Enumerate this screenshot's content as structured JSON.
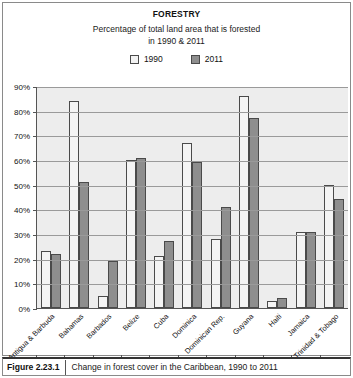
{
  "chart_data": {
    "type": "bar",
    "title": "FORESTRY",
    "subtitle_line1": "Percentage of total land area that is forested",
    "subtitle_line2": "in 1990 & 2011",
    "xlabel": "",
    "ylabel": "",
    "ylim": [
      0,
      90
    ],
    "ytick_labels": [
      "90%",
      "80%",
      "70%",
      "60%",
      "50%",
      "40%",
      "30%",
      "20%",
      "10%",
      "0%"
    ],
    "ytick_values": [
      90,
      80,
      70,
      60,
      50,
      40,
      30,
      20,
      10,
      0
    ],
    "grid": true,
    "legend_position": "top",
    "categories": [
      "Antigua & Barbuda",
      "Bahamas",
      "Barbados",
      "Belize",
      "Cuba",
      "Dominica",
      "Dominican Rep.",
      "Guyana",
      "Haiti",
      "Jamaica",
      "Trinidad & Tobago"
    ],
    "series": [
      {
        "name": "1990",
        "color": "#f4f4f4",
        "values": [
          23,
          84,
          5,
          60,
          21,
          67,
          28,
          86,
          3,
          31,
          50
        ]
      },
      {
        "name": "2011",
        "color": "#8e8e8e",
        "values": [
          22,
          51,
          19,
          61,
          27,
          59,
          41,
          77,
          4,
          31,
          44
        ]
      }
    ]
  },
  "caption": {
    "tag": "Figure 2.23.1",
    "text": "Change in forest cover in the Caribbean, 1990 to 2011"
  }
}
